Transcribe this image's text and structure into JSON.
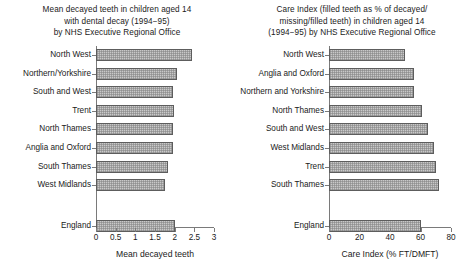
{
  "charts": [
    {
      "title_lines": [
        "Mean decayed teeth in children aged 14",
        "with dental decay (1994−95)",
        "by NHS Executive Regional Office"
      ],
      "xlabel": "Mean decayed teeth",
      "xticks": [
        "0",
        "0.5",
        "1",
        "1.5",
        "2",
        "2.5",
        "3"
      ],
      "chart_data": {
        "type": "bar",
        "orientation": "horizontal",
        "title": "Mean decayed teeth in children aged 14 with dental decay (1994−95) by NHS Executive Regional Office",
        "xlabel": "Mean decayed teeth",
        "ylabel": "",
        "xlim": [
          0,
          3
        ],
        "xticks": [
          0,
          0.5,
          1,
          1.5,
          2,
          2.5,
          3
        ],
        "grid": false,
        "legend": "none",
        "categories": [
          "North West",
          "Northern/Yorkshire",
          "South and West",
          "Trent",
          "North Thames",
          "Anglia and Oxford",
          "South Thames",
          "West Midlands",
          "England"
        ],
        "values": [
          2.45,
          2.05,
          1.95,
          1.98,
          1.96,
          1.95,
          1.83,
          1.75,
          2.0
        ]
      }
    },
    {
      "title_lines": [
        "Care Index (filled teeth as % of decayed/",
        "missing/filled teeth) in children aged 14",
        "(1994−95) by NHS Executive Regional Office"
      ],
      "xlabel": "Care Index (% FT/DMFT)",
      "xticks": [
        "0",
        "20",
        "40",
        "60",
        "80"
      ],
      "chart_data": {
        "type": "bar",
        "orientation": "horizontal",
        "title": "Care Index (filled teeth as % of decayed/missing/filled teeth) in children aged 14 (1994−95) by NHS Executive Regional Office",
        "xlabel": "Care Index (% FT/DMFT)",
        "ylabel": "",
        "xlim": [
          0,
          80
        ],
        "xticks": [
          0,
          20,
          40,
          60,
          80
        ],
        "grid": false,
        "legend": "none",
        "categories": [
          "North West",
          "Anglia and Oxford",
          "Northern and Yorkshire",
          "North Thames",
          "South and West",
          "West Midlands",
          "Trent",
          "South Thames",
          "England"
        ],
        "values": [
          50,
          56,
          56,
          61,
          65,
          69,
          70,
          72,
          60
        ]
      }
    }
  ],
  "style": {
    "bar_fill": "#c9c9c9",
    "bar_edge": "#5d5d5d",
    "axis_color": "#7a7a7a",
    "text_color": "#1a1a1a",
    "background": "#ffffff"
  }
}
